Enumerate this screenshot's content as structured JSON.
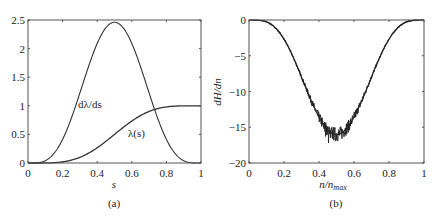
{
  "chart_data": [
    {
      "id": "a",
      "type": "line",
      "caption": "(a)",
      "title": "",
      "xlabel": "s",
      "ylabel": "",
      "xlim": [
        0,
        1
      ],
      "ylim": [
        0,
        2.5
      ],
      "xticks": [
        0,
        0.2,
        0.4,
        0.6,
        0.8,
        1
      ],
      "xtick_labels": [
        "0",
        "0.2",
        "0.4",
        "0.6",
        "0.8",
        "1"
      ],
      "yticks": [
        0,
        0.5,
        1,
        1.5,
        2,
        2.5
      ],
      "ytick_labels": [
        "0",
        "0.5",
        "1",
        "1.5",
        "2",
        "2.5"
      ],
      "grid": false,
      "legend": "none (inline annotations)",
      "series": [
        {
          "name": "dλ/ds",
          "annotation": "dλ/ds",
          "x": [
            0,
            0.1,
            0.2,
            0.3,
            0.4,
            0.5,
            0.6,
            0.7,
            0.8,
            0.9,
            1
          ],
          "values": [
            0,
            0.034,
            0.413,
            1.225,
            2.09,
            2.461,
            2.09,
            1.225,
            0.413,
            0.034,
            0
          ]
        },
        {
          "name": "λ(s)",
          "annotation": "λ(s)",
          "x": [
            0,
            0.1,
            0.2,
            0.3,
            0.4,
            0.5,
            0.6,
            0.7,
            0.8,
            0.9,
            1
          ],
          "values": [
            0,
            0.001,
            0.02,
            0.099,
            0.267,
            0.5,
            0.733,
            0.901,
            0.98,
            0.999,
            1
          ]
        }
      ]
    },
    {
      "id": "b",
      "type": "line",
      "caption": "(b)",
      "title": "",
      "xlabel": "n/n_max",
      "xlabel_main": "n/n",
      "xlabel_sub": "max",
      "ylabel": "dH/dn",
      "xlim": [
        0,
        1
      ],
      "ylim": [
        -20,
        0
      ],
      "xticks": [
        0,
        0.2,
        0.4,
        0.6,
        0.8,
        1
      ],
      "xtick_labels": [
        "0",
        "0.2",
        "0.4",
        "0.6",
        "0.8",
        "1"
      ],
      "yticks": [
        -20,
        -15,
        -10,
        -5,
        0
      ],
      "ytick_labels": [
        "−20",
        "−15",
        "−10",
        "−5",
        "0"
      ],
      "grid": false,
      "legend": "none",
      "series": [
        {
          "name": "dH/dn (noisy)",
          "x": [
            0,
            0.1,
            0.2,
            0.3,
            0.4,
            0.45,
            0.5,
            0.55,
            0.6,
            0.7,
            0.8,
            0.9,
            1
          ],
          "values": [
            0,
            -0.2,
            -3,
            -8,
            -13.5,
            -16,
            -16,
            -15.5,
            -13.5,
            -8,
            -3,
            -0.2,
            0
          ]
        }
      ]
    }
  ]
}
